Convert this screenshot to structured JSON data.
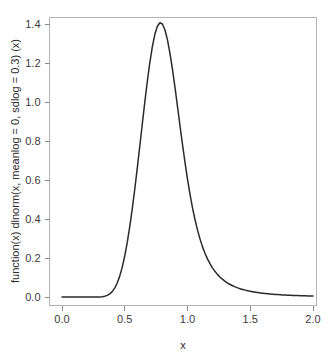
{
  "chart_data": {
    "type": "line",
    "title": "",
    "xlabel": "x",
    "ylabel": "function(x) dlnorm(x, meanlog = 0, sdlog = 0.3) (x)",
    "xlim": [
      0.0,
      2.0
    ],
    "ylim": [
      0.0,
      1.4066
    ],
    "grid": false,
    "legend": null,
    "xticks": [
      "0.0",
      "0.5",
      "1.0",
      "1.5",
      "2.0"
    ],
    "xtick_values": [
      0.0,
      0.5,
      1.0,
      1.5,
      2.0
    ],
    "yticks": [
      "0.0",
      "0.2",
      "0.4",
      "0.6",
      "0.8",
      "1.0",
      "1.2",
      "1.4"
    ],
    "ytick_values": [
      0.0,
      0.2,
      0.4,
      0.6,
      0.8,
      1.0,
      1.2,
      1.4
    ],
    "series": [
      {
        "name": "dlnorm(x, meanlog = 0, sdlog = 0.3)",
        "color": "#2a2a2a",
        "x": [
          0.0,
          0.02,
          0.04,
          0.06,
          0.08,
          0.1,
          0.12,
          0.14,
          0.16,
          0.18,
          0.2,
          0.22,
          0.24,
          0.26,
          0.28,
          0.3,
          0.32,
          0.34,
          0.36,
          0.38,
          0.4,
          0.42,
          0.44,
          0.46,
          0.48,
          0.5,
          0.52,
          0.54,
          0.56,
          0.58,
          0.6,
          0.62,
          0.64,
          0.66,
          0.68,
          0.7,
          0.72,
          0.74,
          0.76,
          0.78,
          0.8,
          0.82,
          0.84,
          0.86,
          0.88,
          0.9,
          0.92,
          0.94,
          0.96,
          0.98,
          1.0,
          1.02,
          1.04,
          1.06,
          1.08,
          1.1,
          1.12,
          1.14,
          1.16,
          1.18,
          1.2,
          1.22,
          1.24,
          1.26,
          1.28,
          1.3,
          1.32,
          1.34,
          1.36,
          1.38,
          1.4,
          1.42,
          1.44,
          1.46,
          1.48,
          1.5,
          1.52,
          1.54,
          1.56,
          1.58,
          1.6,
          1.62,
          1.64,
          1.66,
          1.68,
          1.7,
          1.72,
          1.74,
          1.76,
          1.78,
          1.8,
          1.82,
          1.84,
          1.86,
          1.88,
          1.9,
          1.92,
          1.94,
          1.96,
          1.98,
          2.0
        ],
        "y": [
          0.0,
          0.0,
          0.0,
          0.0,
          0.0,
          0.0,
          0.0,
          0.0,
          0.0,
          0.0,
          0.0,
          0.0,
          0.0,
          0.0001,
          0.0003,
          0.0008,
          0.0022,
          0.0051,
          0.0106,
          0.0203,
          0.0358,
          0.0593,
          0.0929,
          0.1386,
          0.1981,
          0.2725,
          0.3624,
          0.4674,
          0.5864,
          0.7172,
          0.8572,
          1.0029,
          1.1505,
          1.2954,
          1.4328,
          1.5572,
          1.6629,
          1.7447,
          1.7984,
          1.8215,
          1.8131,
          1.7746,
          1.7088,
          1.6199,
          1.513,
          1.3936,
          1.2672,
          1.1389,
          1.0132,
          0.8936,
          0.7828,
          0.6821,
          0.5923,
          0.5131,
          0.4441,
          0.3844,
          0.333,
          0.289,
          0.2515,
          0.2194,
          0.1921,
          0.1687,
          0.1487,
          0.1315,
          0.1167,
          0.1039,
          0.0928,
          0.0831,
          0.0747,
          0.0673,
          0.0608,
          0.0551,
          0.05,
          0.0456,
          0.0416,
          0.0381,
          0.0349,
          0.0321,
          0.0295,
          0.0272,
          0.0251,
          0.0232,
          0.0215,
          0.0199,
          0.0185,
          0.0172,
          0.016,
          0.0149,
          0.0139,
          0.013,
          0.0121,
          0.0113,
          0.0106,
          0.0099,
          0.0093,
          0.0088,
          0.0082,
          0.0078,
          0.0073,
          0.0069,
          0.0065
        ]
      }
    ],
    "peak": {
      "x": 0.9139,
      "y": 1.4066
    },
    "colors": {
      "curve": "#2a2a2a",
      "frame": "#b4b4b4",
      "tick": "#8a8a8a",
      "text": "#3a3a3a",
      "background": "#ffffff"
    }
  }
}
